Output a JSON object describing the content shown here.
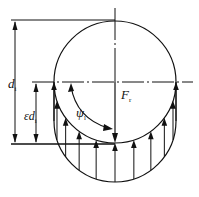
{
  "diagram": {
    "labels": {
      "diameter": "d",
      "diameter_sub": "i",
      "load_zone_prefix": "ε",
      "load_zone_d": "d",
      "load_zone_sub": "i",
      "angle": "ψ",
      "angle_sub": "l",
      "force": "F",
      "force_sub": "r"
    },
    "load_arrow_count": 11,
    "colors": {
      "line": "#111111",
      "background": "#ffffff"
    }
  }
}
